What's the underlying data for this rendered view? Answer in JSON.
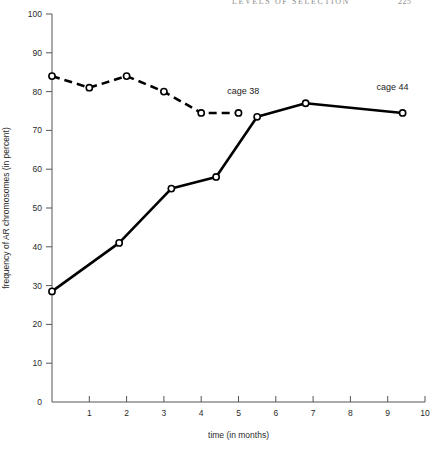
{
  "running_head": {
    "title": "LEVELS OF SELECTION",
    "page": "225"
  },
  "chart_data": {
    "type": "line",
    "title": "",
    "subtitle": "",
    "xlabel": "time (in months)",
    "ylabel": "frequency of AR chromosomes (in percent)",
    "xlim": [
      0,
      10
    ],
    "ylim": [
      0,
      100
    ],
    "xticks": [
      0,
      1,
      2,
      3,
      4,
      5,
      6,
      7,
      8,
      9,
      10
    ],
    "xticklabels": [
      "",
      "1",
      "2",
      "3",
      "4",
      "5",
      "6",
      "7",
      "8",
      "9",
      "10"
    ],
    "yticks": [
      0,
      10,
      20,
      30,
      40,
      50,
      60,
      70,
      80,
      90,
      100
    ],
    "yticklabels": [
      "0",
      "10",
      "20",
      "30",
      "40",
      "50",
      "60",
      "70",
      "80",
      "90",
      "100"
    ],
    "grid": false,
    "legend_position": "inline-annotation",
    "marker": "open-circle",
    "series": [
      {
        "name": "cage 38",
        "style": "dashed",
        "color": "#000000",
        "label_text": "cage 38",
        "points": [
          {
            "x": 0.0,
            "y": 84.0
          },
          {
            "x": 1.0,
            "y": 81.0
          },
          {
            "x": 2.0,
            "y": 84.0
          },
          {
            "x": 3.0,
            "y": 80.0
          },
          {
            "x": 4.0,
            "y": 74.5
          },
          {
            "x": 5.0,
            "y": 74.5
          }
        ]
      },
      {
        "name": "cage 44",
        "style": "solid",
        "color": "#000000",
        "label_text": "cage 44",
        "points": [
          {
            "x": 0.0,
            "y": 28.5
          },
          {
            "x": 1.8,
            "y": 41.0
          },
          {
            "x": 3.2,
            "y": 55.0
          },
          {
            "x": 4.4,
            "y": 58.0
          },
          {
            "x": 5.5,
            "y": 73.5
          },
          {
            "x": 6.8,
            "y": 77.0
          },
          {
            "x": 9.4,
            "y": 74.5
          }
        ]
      }
    ],
    "annotations": [
      {
        "text": "cage 38",
        "x": 4.7,
        "y": 79.5
      },
      {
        "text": "cage 44",
        "x": 8.7,
        "y": 80.5
      }
    ]
  }
}
